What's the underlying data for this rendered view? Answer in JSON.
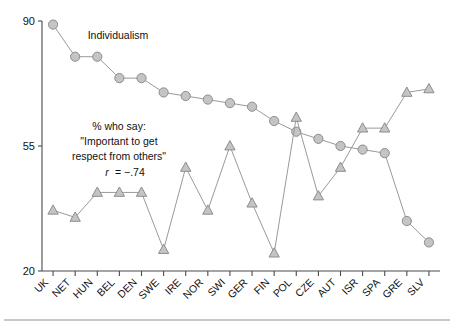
{
  "chart_data": {
    "type": "line",
    "title": "",
    "xlabel": "",
    "ylabel": "",
    "ylim": [
      20,
      90
    ],
    "yticks": [
      20,
      55,
      90
    ],
    "ytick_labels": [
      "20",
      "55",
      "90"
    ],
    "grid": false,
    "legend_position": "inline-annotation",
    "categories": [
      "UK",
      "NET",
      "HUN",
      "BEL",
      "DEN",
      "SWE",
      "IRE",
      "NOR",
      "SWI",
      "GER",
      "FIN",
      "POL",
      "CZE",
      "AUT",
      "ISR",
      "SPA",
      "GRE",
      "SLV"
    ],
    "series": [
      {
        "name": "Individualism",
        "marker": "circle",
        "values": [
          89,
          80,
          80,
          74,
          74,
          70,
          69,
          68,
          67,
          66,
          62,
          59,
          57,
          55,
          54,
          53,
          34,
          28
        ]
      },
      {
        "name": "% who say: \"Important to get respect from others\"",
        "marker": "triangle",
        "values": [
          37,
          35,
          42,
          42,
          42,
          26,
          49,
          37,
          55,
          39,
          25,
          63,
          41,
          49,
          60,
          60,
          70,
          71
        ]
      }
    ],
    "annotations": [
      {
        "id": "series-1-label",
        "text": "Individualism",
        "lines": [
          "Individualism"
        ]
      },
      {
        "id": "series-2-label",
        "lines": [
          "% who say:",
          "\"Important to get",
          "respect from others\"",
          "r = −.74"
        ],
        "correlation_symbol": "r",
        "correlation_value": "= −.74"
      }
    ]
  },
  "geometry": {
    "plot_left": 42,
    "plot_right": 440,
    "y_top_px": 21,
    "y_bottom_px": 271,
    "y_top_value": 90,
    "y_bottom_value": 20
  },
  "labels": {
    "y_tick_90": "90",
    "y_tick_55": "55",
    "y_tick_20": "20",
    "individualism": "Individualism",
    "anno_line1": "% who say:",
    "anno_line2": "\"Important to get",
    "anno_line3": "respect from others\"",
    "anno_r_symbol": "r",
    "anno_r_value": "= −.74"
  },
  "colors": {
    "marker_fill": "#c4c4c4",
    "marker_stroke": "#8d8d8d",
    "line": "#9a9a9a",
    "axis": "#4a4a4a",
    "text": "#111111",
    "background": "#ffffff",
    "footer_rule": "#8f8f8f"
  }
}
